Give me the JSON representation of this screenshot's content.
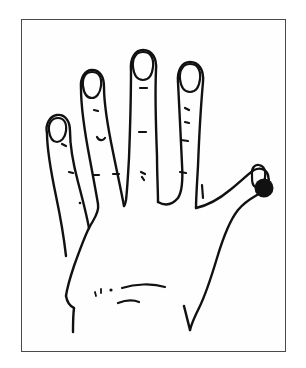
{
  "page": {
    "width": 306,
    "height": 368,
    "background_color": "#ffffff",
    "kind": "line-drawing"
  },
  "frame": {
    "name": "border-rectangle",
    "x": 21,
    "y": 19,
    "width": 265,
    "height": 333,
    "stroke_color": "#4a4a4a",
    "stroke_width": 1.5,
    "fill_color": "#fefefe"
  },
  "drawing": {
    "title": "",
    "caption": "",
    "ink_color": "#111111",
    "view": "dorsal",
    "hand": "left",
    "description": "Outline drawing of the back of a hand with five fingers spread, fingernails outlined, knuckle crease dashes, and wrist crease lines.",
    "parts": [
      {
        "name": "pinky-finger",
        "label": "pinky"
      },
      {
        "name": "ring-finger",
        "label": "ring"
      },
      {
        "name": "middle-finger",
        "label": "middle"
      },
      {
        "name": "index-finger",
        "label": "index"
      },
      {
        "name": "thumb",
        "label": "thumb"
      },
      {
        "name": "palm-back",
        "label": "back of hand"
      },
      {
        "name": "wrist",
        "label": "wrist"
      }
    ],
    "nails": [
      {
        "name": "pinky-nail",
        "cx": 57,
        "cy": 127,
        "rx": 9,
        "ry": 10
      },
      {
        "name": "ring-nail",
        "cx": 92,
        "cy": 82,
        "rx": 9.5,
        "ry": 10.5
      },
      {
        "name": "middle-nail",
        "cx": 143,
        "cy": 63,
        "rx": 10,
        "ry": 10.5
      },
      {
        "name": "index-nail",
        "cx": 190,
        "cy": 75,
        "rx": 10,
        "ry": 10.5
      },
      {
        "name": "thumb-nail",
        "cx": 258,
        "cy": 174,
        "rx": 7,
        "ry": 8.5
      }
    ]
  },
  "marker": {
    "name": "thumb-tip-marker",
    "shape": "filled-circle",
    "color": "#111111",
    "cx": 264,
    "cy": 188,
    "r": 9.5,
    "location_label": "thumb tip"
  }
}
